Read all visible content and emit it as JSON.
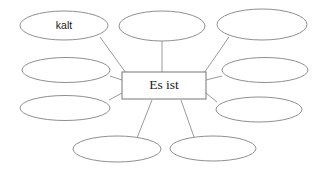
{
  "diagram": {
    "type": "word-web",
    "title": "Es ist",
    "canvas": {
      "width": 331,
      "height": 174,
      "background": "#ffffff"
    },
    "colors": {
      "ellipse_stroke": "#8f8f8f",
      "rect_stroke": "#777777",
      "connector_stroke": "#9a9a9a",
      "text": "#1a1a1a",
      "fill": "#ffffff"
    },
    "center": {
      "label": "Es ist",
      "shape": "rectangle",
      "x": 122,
      "y": 72,
      "width": 84,
      "height": 27,
      "cx": 164,
      "cy": 85.5
    },
    "nodes": [
      {
        "id": "node-top-left",
        "label": "kalt",
        "filled": true,
        "cx": 64,
        "cy": 25.5,
        "rx": 44,
        "ry": 14.5
      },
      {
        "id": "node-top-center",
        "label": "",
        "filled": false,
        "cx": 162,
        "cy": 26,
        "rx": 43,
        "ry": 15
      },
      {
        "id": "node-top-right",
        "label": "",
        "filled": false,
        "cx": 262,
        "cy": 24.5,
        "rx": 45,
        "ry": 15.5
      },
      {
        "id": "node-middle-left",
        "label": "",
        "filled": false,
        "cx": 66,
        "cy": 70,
        "rx": 44,
        "ry": 12.5
      },
      {
        "id": "node-middle-right",
        "label": "",
        "filled": false,
        "cx": 265,
        "cy": 70,
        "rx": 43,
        "ry": 12.5
      },
      {
        "id": "node-lower-left",
        "label": "",
        "filled": false,
        "cx": 65,
        "cy": 108,
        "rx": 45,
        "ry": 12.5
      },
      {
        "id": "node-lower-right",
        "label": "",
        "filled": false,
        "cx": 259,
        "cy": 109.5,
        "rx": 43,
        "ry": 12.5
      },
      {
        "id": "node-bottom-left",
        "label": "",
        "filled": false,
        "cx": 117,
        "cy": 149,
        "rx": 44,
        "ry": 13
      },
      {
        "id": "node-bottom-right",
        "label": "",
        "filled": false,
        "cx": 213,
        "cy": 148.5,
        "rx": 43,
        "ry": 12.5
      }
    ],
    "connectors": [
      {
        "id": "link-top-left",
        "from": "node-top-left",
        "x1": 100,
        "y1": 37,
        "x2": 126,
        "y2": 73
      },
      {
        "id": "link-top-center",
        "from": "node-top-center",
        "x1": 162,
        "y1": 41,
        "x2": 162,
        "y2": 72
      },
      {
        "id": "link-top-right",
        "from": "node-top-right",
        "x1": 229,
        "y1": 37,
        "x2": 204,
        "y2": 73
      },
      {
        "id": "link-middle-left",
        "from": "node-middle-left",
        "x1": 110,
        "y1": 76,
        "x2": 122,
        "y2": 80
      },
      {
        "id": "link-middle-right",
        "from": "node-middle-right",
        "x1": 222,
        "y1": 76,
        "x2": 206,
        "y2": 80
      },
      {
        "id": "link-lower-left",
        "from": "node-lower-left",
        "x1": 109,
        "y1": 100,
        "x2": 122,
        "y2": 93
      },
      {
        "id": "link-lower-right",
        "from": "node-lower-right",
        "x1": 217,
        "y1": 102,
        "x2": 206,
        "y2": 93
      },
      {
        "id": "link-bottom-left",
        "from": "node-bottom-left",
        "x1": 137,
        "y1": 138,
        "x2": 152,
        "y2": 100
      },
      {
        "id": "link-bottom-right",
        "from": "node-bottom-right",
        "x1": 194,
        "y1": 137,
        "x2": 181,
        "y2": 100
      }
    ]
  }
}
